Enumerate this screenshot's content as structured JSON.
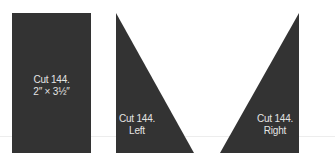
{
  "colors": {
    "fabric": "#333333",
    "label_text": "#e4e4e4",
    "background": "#ffffff",
    "guide_line": "#ededed"
  },
  "pieces": [
    {
      "id": "rectangle",
      "shape": "rectangle",
      "line1": "Cut 144.",
      "line2": "2″ × 3½″"
    },
    {
      "id": "left-triangle",
      "shape": "right-triangle-left",
      "line1": "Cut 144.",
      "line2": "Left"
    },
    {
      "id": "right-triangle",
      "shape": "right-triangle-right",
      "line1": "Cut 144.",
      "line2": "Right"
    }
  ]
}
